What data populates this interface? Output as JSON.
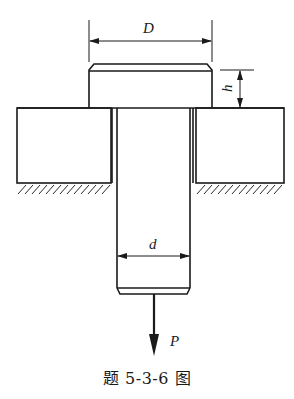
{
  "figure": {
    "caption": "题 5-3-6 图",
    "labels": {
      "head_diameter": "D",
      "head_height": "h",
      "shank_diameter": "d",
      "load": "P"
    },
    "components": [
      {
        "name": "bolt-head",
        "description": "Cylindrical head of diameter D and height h with chamfered top edge"
      },
      {
        "name": "bolt-shank",
        "description": "Shank of diameter d passing through hole in plate, chamfered bottom end"
      },
      {
        "name": "plate",
        "description": "Plate with through-hole, supported on ground (hatched)"
      },
      {
        "name": "load-arrow",
        "description": "Tensile force P applied downward at shank end"
      }
    ],
    "colors": {
      "line": "#1a1a1a",
      "background": "#ffffff"
    }
  }
}
